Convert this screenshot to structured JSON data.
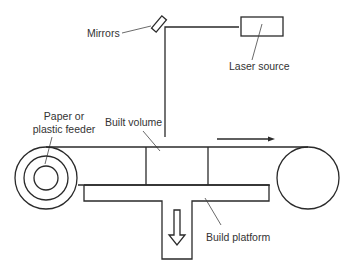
{
  "diagram": {
    "type": "laminated-object-manufacturing-schematic",
    "labels": {
      "mirrors": "Mirrors",
      "laser_source": "Laser source",
      "feeder_line1": "Paper or",
      "feeder_line2": "plastic feeder",
      "built_volume": "Built volume",
      "build_platform": "Build platform"
    },
    "components": [
      "laser-source",
      "mirror",
      "laser-beam",
      "feed-roller",
      "take-up-roller",
      "sheet-material",
      "built-volume",
      "build-platform",
      "down-arrow",
      "feed-direction-arrow"
    ],
    "colors": {
      "line": "#2a2a2a",
      "text": "#333333",
      "background": "#ffffff"
    }
  }
}
